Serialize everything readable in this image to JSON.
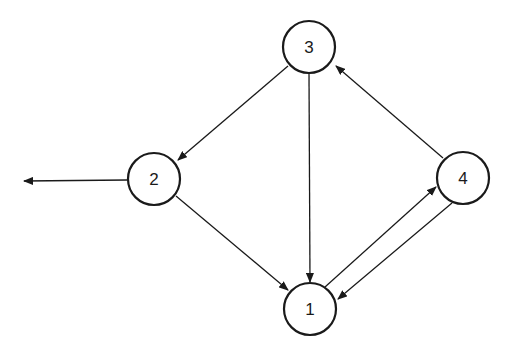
{
  "diagram": {
    "type": "directed-graph",
    "nodes": [
      {
        "id": "1",
        "label": "1",
        "cx": 310,
        "cy": 309
      },
      {
        "id": "2",
        "label": "2",
        "cx": 154,
        "cy": 179
      },
      {
        "id": "3",
        "label": "3",
        "cx": 309,
        "cy": 47
      },
      {
        "id": "4",
        "label": "4",
        "cx": 463,
        "cy": 178
      }
    ],
    "edges": [
      {
        "from": "3",
        "to": "2"
      },
      {
        "from": "3",
        "to": "1"
      },
      {
        "from": "2",
        "to": "1"
      },
      {
        "from": "1",
        "to": "4"
      },
      {
        "from": "4",
        "to": "1"
      },
      {
        "from": "4",
        "to": "3"
      },
      {
        "from": "2",
        "to": "outside-left"
      }
    ],
    "colors": {
      "stroke": "#1a1a1a",
      "background": "#ffffff"
    }
  }
}
